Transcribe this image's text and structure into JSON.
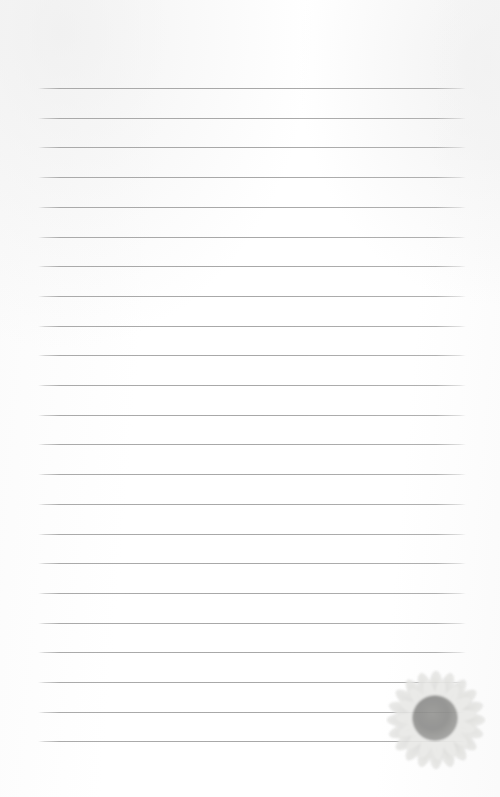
{
  "document": {
    "type": "lined-notepaper",
    "title": "Blank Lined Notepaper Page",
    "page_width": 500,
    "page_height": 797,
    "background_color": "#ffffff",
    "text_content": "",
    "placeholder": ""
  },
  "ruled_lines": {
    "icon_name": "horizontal-rule",
    "count": 23,
    "color": "#a8a8a8",
    "thickness_px": 1,
    "left_x": 38,
    "right_x": 466,
    "first_y": 88,
    "spacing_px": 29.7,
    "positions_y": [
      88,
      117.7,
      147.4,
      177.1,
      206.8,
      236.5,
      266.2,
      295.9,
      325.6,
      355.3,
      385,
      414.7,
      444.4,
      474.1,
      503.8,
      533.5,
      563.2,
      592.9,
      622.6,
      652.3,
      682,
      711.7,
      741.4
    ]
  },
  "decoration": {
    "name": "sunflower",
    "icon_name": "sunflower-icon",
    "description": "Faded grayscale sunflower in lower right corner",
    "x": 392,
    "y": 673,
    "width": 88,
    "height": 94,
    "center_color": "#8b8b89",
    "petal_color": "#e2e2e0",
    "opacity": 0.95
  }
}
